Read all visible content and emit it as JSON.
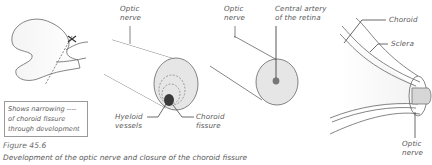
{
  "figure": {
    "number": "Figure 45.6",
    "caption": "Development of the optic nerve and closure of the choroid fissure"
  },
  "legend": {
    "lines": [
      "Shows narrowing ----",
      "of choroid fissure",
      "through development"
    ]
  },
  "panels": [
    {
      "id": "optic-cup",
      "labels": []
    },
    {
      "id": "early-optic-stalk",
      "labels": {
        "optic_nerve": [
          "Optic",
          "nerve"
        ],
        "hyaloid_vessels": [
          "Hyeloid",
          "vessels"
        ],
        "choroid_fissure": [
          "Choroid",
          "fissure"
        ]
      }
    },
    {
      "id": "closed-optic-nerve",
      "labels": {
        "optic_nerve": [
          "Optic",
          "nerve"
        ],
        "central_artery": [
          "Central artery",
          "of the retina"
        ]
      }
    },
    {
      "id": "eye-connection",
      "labels": {
        "choroid": "Choroid",
        "sclera": "Sclera",
        "optic_nerve": [
          "Optic",
          "nerve"
        ]
      }
    }
  ],
  "colors": {
    "line": "#5a5a5a",
    "fill_light": "#ececec",
    "fill_mid": "#d9d9d9",
    "vessel": "#3a3a3a",
    "artery": "#777777"
  }
}
